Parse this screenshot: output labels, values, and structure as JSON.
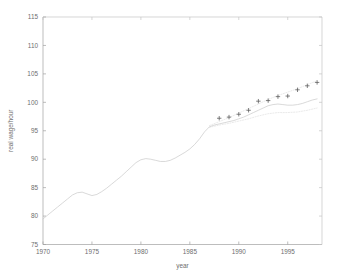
{
  "chart_data": {
    "type": "line",
    "title": "",
    "xlabel": "year",
    "ylabel": "real wage/hour",
    "xlim": [
      1970,
      1998.5
    ],
    "ylim": [
      75,
      115
    ],
    "xticks": [
      1970,
      1975,
      1980,
      1985,
      1990,
      1995
    ],
    "yticks": [
      75,
      80,
      85,
      90,
      95,
      100,
      105,
      110,
      115
    ],
    "xtick_labels": [
      "1970",
      "1975",
      "1980",
      "1985",
      "1990",
      "1995"
    ],
    "ytick_labels": [
      "75",
      "80",
      "85",
      "90",
      "95",
      "100",
      "105",
      "110",
      "115"
    ],
    "grid": false,
    "legend": null,
    "series": [
      {
        "name": "real wage/hour (historical series)",
        "type": "line",
        "style": "solid",
        "color": "#c8c8c8",
        "x": [
          1970,
          1970.5,
          1971,
          1971.5,
          1972,
          1972.5,
          1973,
          1973.5,
          1974,
          1974.5,
          1975,
          1975.5,
          1976,
          1976.5,
          1977,
          1977.5,
          1978,
          1978.5,
          1979,
          1979.5,
          1980,
          1980.5,
          1981,
          1981.5,
          1982,
          1982.5,
          1983,
          1983.5,
          1984,
          1984.5,
          1985,
          1985.5,
          1986,
          1986.5,
          1987,
          1987.5,
          1988,
          1988.5,
          1989,
          1989.5,
          1990,
          1990.5,
          1991,
          1991.5,
          1992,
          1992.5,
          1993,
          1993.5,
          1994,
          1994.5,
          1995,
          1995.5,
          1996,
          1996.5,
          1997,
          1997.5,
          1998
        ],
        "y": [
          79.5,
          80.2,
          80.9,
          81.6,
          82.3,
          83.0,
          83.7,
          84.1,
          84.2,
          83.9,
          83.6,
          83.8,
          84.3,
          84.9,
          85.6,
          86.3,
          87.0,
          87.8,
          88.6,
          89.4,
          89.9,
          90.1,
          90.0,
          89.8,
          89.6,
          89.6,
          89.8,
          90.2,
          90.7,
          91.2,
          91.8,
          92.6,
          93.6,
          94.8,
          95.7,
          96.0,
          96.2,
          96.4,
          96.6,
          96.8,
          97.1,
          97.4,
          97.8,
          98.2,
          98.6,
          99.0,
          99.4,
          99.6,
          99.7,
          99.6,
          99.5,
          99.5,
          99.6,
          99.8,
          100.1,
          100.4,
          100.6
        ]
      },
      {
        "name": "upper band",
        "type": "line",
        "style": "dotted",
        "color": "#d8d8d8",
        "x": [
          1987,
          1988,
          1989,
          1990,
          1991,
          1992,
          1993,
          1994,
          1995,
          1996,
          1997,
          1998
        ],
        "y": [
          95.9,
          96.6,
          97.3,
          98.1,
          98.9,
          99.7,
          100.5,
          101.2,
          101.8,
          102.4,
          103.1,
          103.8
        ]
      },
      {
        "name": "lower band",
        "type": "line",
        "style": "dotted",
        "color": "#d8d8d8",
        "x": [
          1987,
          1988,
          1989,
          1990,
          1991,
          1992,
          1993,
          1994,
          1995,
          1996,
          1997,
          1998
        ],
        "y": [
          95.6,
          96.0,
          96.3,
          96.7,
          97.1,
          97.6,
          98.0,
          98.2,
          98.2,
          98.3,
          98.6,
          99.0
        ]
      },
      {
        "name": "fitted / forecast points",
        "type": "scatter",
        "marker": "plus",
        "color": "#555555",
        "x": [
          1988,
          1989,
          1990,
          1991,
          1992,
          1993,
          1994,
          1995,
          1996,
          1997,
          1998
        ],
        "y": [
          97.2,
          97.4,
          97.9,
          98.6,
          100.2,
          100.3,
          101.0,
          101.1,
          102.2,
          102.9,
          103.5
        ]
      }
    ],
    "colors": {
      "axis": "#a0a0a0",
      "tick_text": "#6e6e6e",
      "line": "#c8c8c8",
      "band": "#d8d8d8",
      "marker": "#555555",
      "background": "#ffffff"
    }
  }
}
